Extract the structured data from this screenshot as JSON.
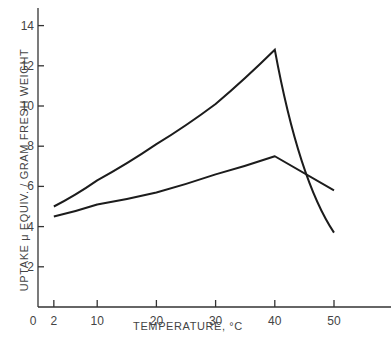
{
  "chart_data": {
    "type": "line",
    "title": "",
    "xlabel": "TEMPERATURE, °C",
    "ylabel": "UPTAKE μ EQUIV. / GRAM FRESH WEIGHT",
    "xlim": [
      0,
      58
    ],
    "ylim": [
      0,
      15
    ],
    "x_ticks": [
      2,
      10,
      20,
      30,
      40,
      50
    ],
    "x_tick_labels": [
      "0",
      "2",
      "10",
      "20",
      "30",
      "40",
      "50"
    ],
    "y_ticks": [
      2,
      4,
      6,
      8,
      10,
      12,
      14
    ],
    "y_tick_labels": [
      "2",
      "4",
      "6",
      "8",
      "10",
      "12",
      "14"
    ],
    "grid": false,
    "legend": null,
    "series": [
      {
        "name": "upper curve",
        "x": [
          2,
          10,
          20,
          30,
          40,
          50
        ],
        "values": [
          5.0,
          6.3,
          8.1,
          10.1,
          12.8,
          3.7
        ]
      },
      {
        "name": "lower curve",
        "x": [
          2,
          10,
          20,
          30,
          40,
          50
        ],
        "values": [
          4.5,
          5.1,
          5.7,
          6.6,
          7.5,
          5.8
        ]
      }
    ]
  }
}
